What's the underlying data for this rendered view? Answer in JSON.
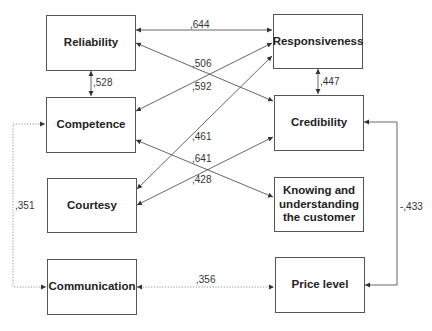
{
  "diagram": {
    "nodes": [
      {
        "id": "reliability",
        "label": "Reliability"
      },
      {
        "id": "responsiveness",
        "label": "Responsiveness"
      },
      {
        "id": "competence",
        "label": "Competence"
      },
      {
        "id": "credibility",
        "label": "Credibility"
      },
      {
        "id": "courtesy",
        "label": "Courtesy"
      },
      {
        "id": "knowing",
        "label": "Knowing and understanding the customer"
      },
      {
        "id": "communication",
        "label": "Communication"
      },
      {
        "id": "price_level",
        "label": "Price level"
      }
    ],
    "edges": [
      {
        "from": "reliability",
        "to": "responsiveness",
        "label": ",644",
        "style": "solid",
        "direction": "both"
      },
      {
        "from": "reliability",
        "to": "credibility",
        "label": ",506",
        "style": "solid",
        "direction": "both"
      },
      {
        "from": "competence",
        "to": "responsiveness",
        "label": ",592",
        "style": "solid",
        "direction": "both"
      },
      {
        "from": "reliability",
        "to": "competence",
        "label": ",528",
        "style": "solid",
        "direction": "both"
      },
      {
        "from": "responsiveness",
        "to": "credibility",
        "label": ",447",
        "style": "solid",
        "direction": "both"
      },
      {
        "from": "courtesy",
        "to": "responsiveness",
        "label": ",461",
        "style": "solid",
        "direction": "both"
      },
      {
        "from": "competence",
        "to": "knowing",
        "label": ",641",
        "style": "solid",
        "direction": "both"
      },
      {
        "from": "courtesy",
        "to": "credibility",
        "label": ",428",
        "style": "solid",
        "direction": "both"
      },
      {
        "from": "competence",
        "to": "communication",
        "label": ",351",
        "style": "dotted",
        "direction": "both"
      },
      {
        "from": "communication",
        "to": "price_level",
        "label": ",356",
        "style": "dotted",
        "direction": "both"
      },
      {
        "from": "credibility",
        "to": "price_level",
        "label": "-,433",
        "style": "solid",
        "direction": "both"
      }
    ]
  }
}
